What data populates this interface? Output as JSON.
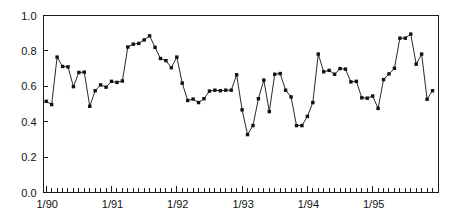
{
  "chart_data": {
    "type": "line",
    "title": "",
    "subtitle": "",
    "xlabel": "",
    "ylabel": "",
    "xlim": [
      0,
      71
    ],
    "ylim": [
      0.0,
      1.0
    ],
    "grid": false,
    "legend": null,
    "marker": "filled-square",
    "line_color": "#111111",
    "marker_color": "#111111",
    "frame_color": "#1a1a1a",
    "background_color": "#ffffff",
    "y_ticks": [
      0.0,
      0.2,
      0.4,
      0.6,
      0.8,
      1.0
    ],
    "y_tick_labels": [
      "0.0",
      "0.2",
      "0.4",
      "0.6",
      "0.8",
      "1.0"
    ],
    "x_tick_count": 72,
    "x_tick_interval": "monthly",
    "x_labeled_ticks": [
      {
        "index": 0,
        "label": "1/90"
      },
      {
        "index": 12,
        "label": "1/91"
      },
      {
        "index": 24,
        "label": "1/92"
      },
      {
        "index": 36,
        "label": "1/93"
      },
      {
        "index": 48,
        "label": "1/94"
      },
      {
        "index": 60,
        "label": "1/95"
      }
    ],
    "x": [
      0,
      1,
      2,
      3,
      4,
      5,
      6,
      7,
      8,
      9,
      10,
      11,
      12,
      13,
      14,
      15,
      16,
      17,
      18,
      19,
      20,
      21,
      22,
      23,
      24,
      25,
      26,
      27,
      28,
      29,
      30,
      31,
      32,
      33,
      34,
      35,
      36,
      37,
      38,
      39,
      40,
      41,
      42,
      43,
      44,
      45,
      46,
      47,
      48,
      49,
      50,
      51,
      52,
      53,
      54,
      55,
      56,
      57,
      58,
      59,
      60,
      61,
      62,
      63,
      64,
      65,
      66,
      67,
      68,
      69,
      70,
      71
    ],
    "x_labels": [
      "1/90",
      "2/90",
      "3/90",
      "4/90",
      "5/90",
      "6/90",
      "7/90",
      "8/90",
      "9/90",
      "10/90",
      "11/90",
      "12/90",
      "1/91",
      "2/91",
      "3/91",
      "4/91",
      "5/91",
      "6/91",
      "7/91",
      "8/91",
      "9/91",
      "10/91",
      "11/91",
      "12/91",
      "1/92",
      "2/92",
      "3/92",
      "4/92",
      "5/92",
      "6/92",
      "7/92",
      "8/92",
      "9/92",
      "10/92",
      "11/92",
      "12/92",
      "1/93",
      "2/93",
      "3/93",
      "4/93",
      "5/93",
      "6/93",
      "7/93",
      "8/93",
      "9/93",
      "10/93",
      "11/93",
      "12/93",
      "1/94",
      "2/94",
      "3/94",
      "4/94",
      "5/94",
      "6/94",
      "7/94",
      "8/94",
      "9/94",
      "10/94",
      "11/94",
      "12/94",
      "1/95",
      "2/95",
      "3/95",
      "4/95",
      "5/95",
      "6/95",
      "7/95",
      "8/95",
      "9/95",
      "10/95",
      "11/95",
      "12/95"
    ],
    "values": [
      0.515,
      0.497,
      0.765,
      0.712,
      0.71,
      0.598,
      0.678,
      0.68,
      0.487,
      0.575,
      0.608,
      0.595,
      0.628,
      0.622,
      0.63,
      0.822,
      0.838,
      0.842,
      0.862,
      0.885,
      0.82,
      0.757,
      0.745,
      0.705,
      0.765,
      0.618,
      0.52,
      0.528,
      0.508,
      0.53,
      0.573,
      0.578,
      0.575,
      0.578,
      0.578,
      0.665,
      0.467,
      0.327,
      0.378,
      0.53,
      0.635,
      0.457,
      0.668,
      0.672,
      0.578,
      0.54,
      0.378,
      0.378,
      0.43,
      0.508,
      0.782,
      0.682,
      0.69,
      0.668,
      0.7,
      0.697,
      0.625,
      0.628,
      0.535,
      0.533,
      0.545,
      0.475,
      0.638,
      0.67,
      0.702,
      0.872,
      0.872,
      0.895,
      0.725,
      0.782,
      0.527,
      0.575
    ]
  }
}
